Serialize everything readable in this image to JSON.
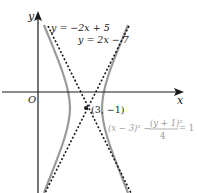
{
  "diagram": {
    "type": "hyperbola-with-asymptotes",
    "axes": {
      "x_label": "x",
      "y_label": "y",
      "origin_label": "O"
    },
    "asymptotes": [
      {
        "label": "y = −2x + 5",
        "style": "dashed"
      },
      {
        "label": "y = 2x − 7",
        "style": "dashed"
      }
    ],
    "center": {
      "label": "(3, −1)"
    },
    "hyperbola": {
      "equation_left": "(x − 3)² −",
      "equation_frac_num": "(y + 1)²",
      "equation_frac_den": "4",
      "equation_right": "= 1",
      "color": "#9a9a9a"
    }
  }
}
